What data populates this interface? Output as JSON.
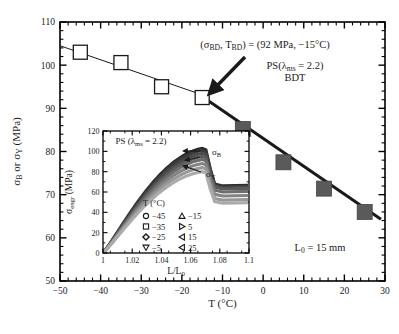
{
  "figure": {
    "background": "#ffffff",
    "axis_color": "#000000",
    "line_color": "#1a1a1a",
    "fill_color": "#5a5a5a"
  },
  "chart_data": {
    "type": "scatter",
    "title": "",
    "xlabel": "T (°C)",
    "ylabel": "σ_B or σ_Y (MPa)",
    "xlim": [
      -50,
      30
    ],
    "ylim": [
      50,
      110
    ],
    "xticks": [
      -50,
      -40,
      -30,
      -20,
      -10,
      0,
      10,
      20,
      30
    ],
    "xtick_labels": [
      "−50",
      "−40",
      "−30",
      "−20",
      "−10",
      "0",
      "10",
      "20",
      "30"
    ],
    "yticks": [
      50,
      60,
      70,
      80,
      90,
      100,
      110
    ],
    "ytick_labels": [
      "50",
      "60",
      "70",
      "80",
      "90",
      "100",
      "110"
    ],
    "minor_ticks_per_interval": 5,
    "grid": false,
    "legend_position": "none",
    "series": [
      {
        "name": "σ_B (brittle, open squares)",
        "marker": "open-square",
        "x": [
          -45,
          -35,
          -25,
          -15
        ],
        "y": [
          103.0,
          100.6,
          95.0,
          92.5
        ]
      },
      {
        "name": "σ_Y (ductile, filled squares)",
        "marker": "filled-square",
        "x": [
          -5,
          5,
          15,
          25
        ],
        "y": [
          85.2,
          77.5,
          71.4,
          66.0
        ]
      }
    ],
    "fit_lines": [
      {
        "name": "thin-fit-line-brittle",
        "x": [
          -50,
          -14
        ],
        "y": [
          104.5,
          92.8
        ],
        "width": 1
      },
      {
        "name": "thick-fit-line-ductile",
        "x": [
          -16,
          29
        ],
        "y": [
          93.4,
          64.3
        ],
        "width": 3
      }
    ],
    "annotations": [
      {
        "name": "bdt-point-label",
        "text": "(σBD, TBD) = (92 MPa, −15°C)",
        "text_parts": {
          "p1": "(σ",
          "sub1": "BD",
          "p2": ", T",
          "sub2": "BD",
          "p3": ") = (92 MPa, −15°C)"
        }
      },
      {
        "name": "material-label",
        "line1_p1": "PS(λ",
        "line1_sub": "ms",
        "line1_p2": " = 2.2)",
        "line2": "BDT"
      },
      {
        "name": "gauge-length-label",
        "p1": "L",
        "sub": "0",
        "p2": " = 15 mm"
      }
    ]
  },
  "inset": {
    "type": "line",
    "title_p1": "PS (λ",
    "title_sub": "ms",
    "title_p2": " = 2.2)",
    "xlabel_p1": "L/L",
    "xlabel_sub": "0",
    "ylabel_p1": "σ",
    "ylabel_sub": "engr",
    "ylabel_p2": " (MPa)",
    "xlim": [
      1.0,
      1.1
    ],
    "ylim": [
      0,
      120
    ],
    "xticks": [
      1,
      1.02,
      1.04,
      1.06,
      1.08,
      1.1
    ],
    "xtick_labels": [
      "1",
      "1.02",
      "1.04",
      "1.06",
      "1.08",
      "1.1"
    ],
    "yticks": [
      0,
      20,
      40,
      60,
      80,
      100,
      120
    ],
    "ytick_labels": [
      "0",
      "20",
      "40",
      "60",
      "80",
      "100",
      "120"
    ],
    "arrow_labels": [
      {
        "name": "sigma-b-label",
        "main": "σ",
        "sub": "B"
      },
      {
        "name": "sigma-y-label",
        "main": "σ",
        "sub": "Y"
      }
    ],
    "legend": {
      "title": "T (°C)",
      "entries": [
        {
          "marker": "circle",
          "label": "−45",
          "peak": 103,
          "plateau": 66
        },
        {
          "marker": "up-triangle",
          "label": "−15",
          "peak": 95,
          "plateau": 63
        },
        {
          "marker": "square",
          "label": "−35",
          "peak": 101,
          "plateau": 65
        },
        {
          "marker": "right-triangle",
          "label": "5",
          "peak": 88,
          "plateau": 56
        },
        {
          "marker": "diamond",
          "label": "−25",
          "peak": 98,
          "plateau": 64
        },
        {
          "marker": "left-triangle-2",
          "label": "15",
          "peak": 84,
          "plateau": 52
        },
        {
          "marker": "down-triangle",
          "label": "−5",
          "peak": 92,
          "plateau": 60
        },
        {
          "marker": "left-triangle",
          "label": "25",
          "peak": 80,
          "plateau": 49
        }
      ]
    },
    "curves": [
      {
        "name": "T-45",
        "peak_y": 103,
        "plateau_y": 66,
        "shade": "#2b2b2b"
      },
      {
        "name": "T-35",
        "peak_y": 101,
        "plateau_y": 65,
        "shade": "#3a3a3a"
      },
      {
        "name": "T-25",
        "peak_y": 98,
        "plateau_y": 64,
        "shade": "#4a4a4a"
      },
      {
        "name": "T-15",
        "peak_y": 95,
        "plateau_y": 63,
        "shade": "#5a5a5a"
      },
      {
        "name": "T-5",
        "peak_y": 92,
        "plateau_y": 60,
        "shade": "#6e6e6e"
      },
      {
        "name": "T5",
        "peak_y": 88,
        "plateau_y": 56,
        "shade": "#838383"
      },
      {
        "name": "T15",
        "peak_y": 84,
        "plateau_y": 52,
        "shade": "#989898"
      },
      {
        "name": "T25",
        "peak_y": 80,
        "plateau_y": 49,
        "shade": "#ababab"
      }
    ]
  }
}
